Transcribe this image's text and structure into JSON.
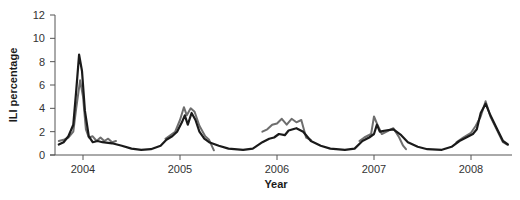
{
  "chart_data": {
    "type": "line",
    "title": "",
    "xlabel": "Year",
    "ylabel": "ILI percentage",
    "ylim": [
      0,
      12
    ],
    "xlim": [
      2003.72,
      2008.42
    ],
    "yticks": [
      0,
      2,
      4,
      6,
      8,
      10,
      12
    ],
    "xticks": [
      2004,
      2005,
      2006,
      2007,
      2008
    ],
    "xtick_labels": [
      "2004",
      "2005",
      "2006",
      "2007",
      "2008"
    ],
    "grid": false,
    "legend": null,
    "series": [
      {
        "name": "Reported ILI (black)",
        "color": "#1a1a1a",
        "segments": [
          [
            [
              2003.75,
              0.9
            ],
            [
              2003.8,
              1.1
            ],
            [
              2003.85,
              1.6
            ],
            [
              2003.9,
              2.6
            ],
            [
              2003.93,
              5.5
            ],
            [
              2003.96,
              8.6
            ],
            [
              2003.99,
              7.2
            ],
            [
              2004.02,
              3.8
            ],
            [
              2004.06,
              1.6
            ],
            [
              2004.1,
              1.1
            ],
            [
              2004.15,
              1.2
            ],
            [
              2004.2,
              1.1
            ],
            [
              2004.3,
              1.0
            ],
            [
              2004.4,
              0.8
            ],
            [
              2004.5,
              0.55
            ],
            [
              2004.6,
              0.45
            ],
            [
              2004.7,
              0.5
            ],
            [
              2004.8,
              0.8
            ],
            [
              2004.86,
              1.3
            ],
            [
              2004.92,
              1.6
            ],
            [
              2004.97,
              2.0
            ],
            [
              2005.02,
              2.8
            ],
            [
              2005.05,
              3.4
            ],
            [
              2005.08,
              2.6
            ],
            [
              2005.12,
              3.6
            ],
            [
              2005.16,
              3.0
            ],
            [
              2005.2,
              2.0
            ],
            [
              2005.25,
              1.4
            ],
            [
              2005.3,
              1.1
            ],
            [
              2005.4,
              0.8
            ],
            [
              2005.5,
              0.55
            ],
            [
              2005.65,
              0.45
            ],
            [
              2005.75,
              0.55
            ],
            [
              2005.85,
              1.1
            ],
            [
              2005.92,
              1.4
            ],
            [
              2005.97,
              1.5
            ],
            [
              2006.02,
              1.8
            ],
            [
              2006.08,
              1.7
            ],
            [
              2006.12,
              2.1
            ],
            [
              2006.2,
              2.3
            ],
            [
              2006.27,
              2.0
            ],
            [
              2006.35,
              1.2
            ],
            [
              2006.45,
              0.8
            ],
            [
              2006.55,
              0.55
            ],
            [
              2006.7,
              0.45
            ],
            [
              2006.8,
              0.55
            ],
            [
              2006.88,
              1.2
            ],
            [
              2006.95,
              1.5
            ],
            [
              2007.0,
              1.8
            ],
            [
              2007.03,
              2.6
            ],
            [
              2007.06,
              2.0
            ],
            [
              2007.12,
              2.1
            ],
            [
              2007.2,
              2.2
            ],
            [
              2007.28,
              1.7
            ],
            [
              2007.35,
              1.1
            ],
            [
              2007.45,
              0.7
            ],
            [
              2007.55,
              0.5
            ],
            [
              2007.7,
              0.45
            ],
            [
              2007.8,
              0.7
            ],
            [
              2007.88,
              1.2
            ],
            [
              2007.95,
              1.5
            ],
            [
              2008.02,
              1.8
            ],
            [
              2008.06,
              2.2
            ],
            [
              2008.1,
              3.6
            ],
            [
              2008.15,
              4.4
            ],
            [
              2008.2,
              3.4
            ],
            [
              2008.27,
              2.2
            ],
            [
              2008.33,
              1.2
            ],
            [
              2008.38,
              0.9
            ]
          ]
        ]
      },
      {
        "name": "Estimated ILI (gray)",
        "color": "#6e6e6e",
        "segments": [
          [
            [
              2003.75,
              1.2
            ],
            [
              2003.8,
              1.3
            ],
            [
              2003.85,
              1.5
            ],
            [
              2003.9,
              2.0
            ],
            [
              2003.93,
              4.0
            ],
            [
              2003.97,
              6.4
            ],
            [
              2004.0,
              5.0
            ],
            [
              2004.03,
              2.2
            ],
            [
              2004.06,
              1.5
            ],
            [
              2004.1,
              1.6
            ],
            [
              2004.14,
              1.2
            ],
            [
              2004.18,
              1.5
            ],
            [
              2004.22,
              1.2
            ],
            [
              2004.26,
              1.4
            ],
            [
              2004.3,
              1.1
            ],
            [
              2004.34,
              1.2
            ]
          ],
          [
            [
              2004.85,
              1.4
            ],
            [
              2004.9,
              1.7
            ],
            [
              2004.95,
              2.0
            ],
            [
              2005.0,
              3.0
            ],
            [
              2005.04,
              4.1
            ],
            [
              2005.07,
              3.4
            ],
            [
              2005.11,
              4.0
            ],
            [
              2005.15,
              3.7
            ],
            [
              2005.2,
              2.5
            ],
            [
              2005.26,
              1.6
            ],
            [
              2005.3,
              1.3
            ],
            [
              2005.35,
              0.4
            ]
          ],
          [
            [
              2005.85,
              2.0
            ],
            [
              2005.9,
              2.2
            ],
            [
              2005.95,
              2.6
            ],
            [
              2006.0,
              2.7
            ],
            [
              2006.05,
              3.1
            ],
            [
              2006.1,
              2.6
            ],
            [
              2006.15,
              3.1
            ],
            [
              2006.2,
              2.8
            ],
            [
              2006.25,
              3.0
            ],
            [
              2006.3,
              1.5
            ],
            [
              2006.35,
              1.3
            ]
          ],
          [
            [
              2006.85,
              1.2
            ],
            [
              2006.9,
              1.5
            ],
            [
              2006.97,
              1.8
            ],
            [
              2007.0,
              3.3
            ],
            [
              2007.04,
              2.5
            ],
            [
              2007.08,
              1.8
            ],
            [
              2007.15,
              2.1
            ],
            [
              2007.2,
              2.3
            ],
            [
              2007.26,
              1.5
            ],
            [
              2007.3,
              0.8
            ],
            [
              2007.33,
              0.5
            ]
          ],
          [
            [
              2007.85,
              1.1
            ],
            [
              2007.92,
              1.5
            ],
            [
              2008.0,
              1.9
            ],
            [
              2008.05,
              2.5
            ],
            [
              2008.1,
              3.3
            ],
            [
              2008.15,
              4.6
            ],
            [
              2008.2,
              3.3
            ],
            [
              2008.27,
              2.1
            ],
            [
              2008.33,
              1.1
            ],
            [
              2008.37,
              0.9
            ]
          ]
        ]
      }
    ]
  },
  "labels": {
    "ylabel": "ILI percentage",
    "xlabel": "Year",
    "yticks": [
      "0",
      "2",
      "4",
      "6",
      "8",
      "10",
      "12"
    ],
    "xticks": [
      "2004",
      "2005",
      "2006",
      "2007",
      "2008"
    ]
  }
}
